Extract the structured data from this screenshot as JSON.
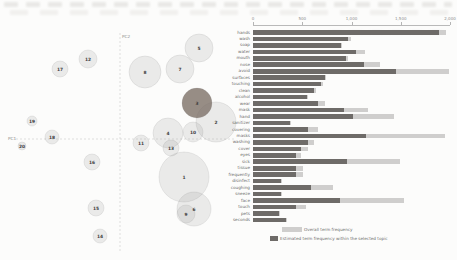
{
  "figure": {
    "colors": {
      "selected_bar": "#6e6b68",
      "overall_bar": "#cfcecd",
      "bubble_fill": "#8f8f8f",
      "bubble_stroke": "#7f7f7f",
      "selected_bubble": "#7d7068",
      "axis_dash": "#c9c9c9",
      "label_text": "#8a8a8a",
      "number_text": "#3f3f3f"
    },
    "legend": {
      "overall_label": "Overall term frequency",
      "selected_label": "Estimated term frequency within the selected topic"
    }
  },
  "chart_data": [
    {
      "type": "scatter",
      "title": "Intertopic Distance Map",
      "xlabel": "PC1",
      "ylabel": "PC2",
      "axes_px": {
        "h_y": 139,
        "h_x1": 16,
        "h_x2": 234,
        "v_x": 120,
        "v_y1": 33,
        "v_y2": 252,
        "xlabel_px": [
          8,
          140
        ],
        "ylabel_px": [
          122,
          38
        ]
      },
      "selected_topic": 3,
      "bubbles": [
        {
          "topic": 1,
          "x": 184,
          "y": 177,
          "r": 25
        },
        {
          "topic": 2,
          "x": 216,
          "y": 122,
          "r": 20
        },
        {
          "topic": 3,
          "x": 197,
          "y": 103,
          "r": 15
        },
        {
          "topic": 4,
          "x": 168,
          "y": 133,
          "r": 15
        },
        {
          "topic": 5,
          "x": 199,
          "y": 48,
          "r": 14
        },
        {
          "topic": 6,
          "x": 194,
          "y": 209,
          "r": 17
        },
        {
          "topic": 7,
          "x": 180,
          "y": 69,
          "r": 14
        },
        {
          "topic": 8,
          "x": 145,
          "y": 72,
          "r": 16
        },
        {
          "topic": 9,
          "x": 186,
          "y": 214,
          "r": 9
        },
        {
          "topic": 10,
          "x": 193,
          "y": 132,
          "r": 10
        },
        {
          "topic": 11,
          "x": 141,
          "y": 143,
          "r": 8
        },
        {
          "topic": 12,
          "x": 88,
          "y": 59,
          "r": 9
        },
        {
          "topic": 13,
          "x": 171,
          "y": 148,
          "r": 8
        },
        {
          "topic": 14,
          "x": 100,
          "y": 236,
          "r": 7
        },
        {
          "topic": 15,
          "x": 96,
          "y": 208,
          "r": 8
        },
        {
          "topic": 16,
          "x": 92,
          "y": 162,
          "r": 8
        },
        {
          "topic": 17,
          "x": 60,
          "y": 69,
          "r": 8
        },
        {
          "topic": 18,
          "x": 52,
          "y": 137,
          "r": 7
        },
        {
          "topic": 19,
          "x": 32,
          "y": 121,
          "r": 5
        },
        {
          "topic": 20,
          "x": 22,
          "y": 146,
          "r": 4
        }
      ]
    },
    {
      "type": "bar",
      "title": "Term frequency for selected topic vs overall",
      "xlabel": "Term frequency",
      "ylabel": "",
      "xlim": [
        0,
        2000
      ],
      "x_ticks": [
        {
          "value": 0,
          "label": "0"
        },
        {
          "value": 500,
          "label": "500"
        },
        {
          "value": 1000,
          "label": "1,000"
        },
        {
          "value": 1500,
          "label": "1,500"
        },
        {
          "value": 2000,
          "label": "2,000"
        }
      ],
      "series": [
        {
          "name": "Estimated term frequency within the selected topic"
        },
        {
          "name": "Overall term frequency"
        }
      ],
      "geom_px": {
        "x0": 253,
        "plot_w": 197,
        "row0_y": 29.5,
        "row_pitch": 6.47,
        "axis_y": 25,
        "tick_y": 22,
        "tick_label_y": 16
      },
      "terms": [
        {
          "term": "hands",
          "selected": 1890,
          "overall": 1960
        },
        {
          "term": "wash",
          "selected": 960,
          "overall": 990
        },
        {
          "term": "soap",
          "selected": 890,
          "overall": 905
        },
        {
          "term": "water",
          "selected": 1050,
          "overall": 1140
        },
        {
          "term": "mouth",
          "selected": 940,
          "overall": 960
        },
        {
          "term": "nose",
          "selected": 1130,
          "overall": 1290
        },
        {
          "term": "avoid",
          "selected": 1450,
          "overall": 1990
        },
        {
          "term": "surfaces",
          "selected": 730,
          "overall": 745
        },
        {
          "term": "touching",
          "selected": 695,
          "overall": 710
        },
        {
          "term": "clean",
          "selected": 620,
          "overall": 635
        },
        {
          "term": "alcohol",
          "selected": 550,
          "overall": 560
        },
        {
          "term": "wear",
          "selected": 660,
          "overall": 730
        },
        {
          "term": "mask",
          "selected": 920,
          "overall": 1170
        },
        {
          "term": "hand",
          "selected": 1020,
          "overall": 1430
        },
        {
          "term": "sanitizer",
          "selected": 375,
          "overall": 385
        },
        {
          "term": "covering",
          "selected": 560,
          "overall": 660
        },
        {
          "term": "masks",
          "selected": 1150,
          "overall": 1950
        },
        {
          "term": "washing",
          "selected": 560,
          "overall": 620
        },
        {
          "term": "cover",
          "selected": 490,
          "overall": 560
        },
        {
          "term": "eyes",
          "selected": 440,
          "overall": 490
        },
        {
          "term": "sick",
          "selected": 950,
          "overall": 1490
        },
        {
          "term": "tissue",
          "selected": 440,
          "overall": 510
        },
        {
          "term": "frequently",
          "selected": 440,
          "overall": 505
        },
        {
          "term": "disinfect",
          "selected": 285,
          "overall": 295
        },
        {
          "term": "coughing",
          "selected": 590,
          "overall": 815
        },
        {
          "term": "sneeze",
          "selected": 285,
          "overall": 295
        },
        {
          "term": "face",
          "selected": 880,
          "overall": 1530
        },
        {
          "term": "touch",
          "selected": 440,
          "overall": 540
        },
        {
          "term": "pets",
          "selected": 265,
          "overall": 275
        },
        {
          "term": "seconds",
          "selected": 340,
          "overall": 350
        }
      ]
    }
  ]
}
